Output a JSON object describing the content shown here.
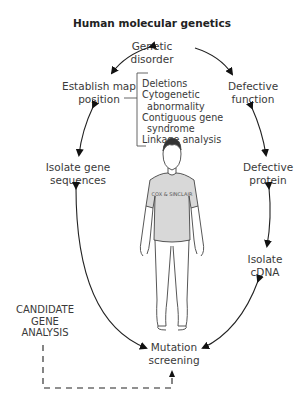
{
  "title": "Human molecular genetics",
  "nodes": {
    "genetic_disorder": [
      "Genetic",
      "disorder"
    ],
    "defective_function": [
      "Defective",
      "function"
    ],
    "defective_protein": [
      "Defective",
      "protein"
    ],
    "isolate_cdna": [
      "Isolate",
      "cDNA"
    ],
    "mutation_screening": [
      "Mutation",
      "screening"
    ],
    "isolate_gene_sequences": [
      "Isolate gene",
      "sequences"
    ],
    "establish_map_position": [
      "Establish map",
      "position"
    ],
    "candidate_gene_analysis": [
      "CANDIDATE",
      "GENE",
      "ANALYSIS"
    ]
  },
  "mapping_methods": [
    "Deletions",
    "Cytogenetic",
    "abnormality",
    "Contiguous gene",
    "syndrome",
    "Linkage analysis"
  ],
  "figure": {
    "shirt_text": "COX & SINCLAIR"
  }
}
